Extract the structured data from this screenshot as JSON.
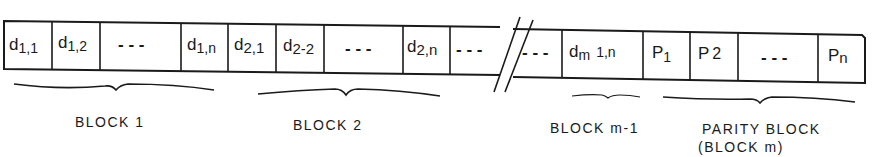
{
  "diagram": {
    "strip": {
      "cells": [
        {
          "id": "d11",
          "main": "d",
          "sub": "1,1",
          "x1": 4,
          "x2": 52
        },
        {
          "id": "d12",
          "main": "d",
          "sub": "1,2",
          "x1": 52,
          "x2": 100
        },
        {
          "id": "e1",
          "main": "---",
          "sub": "",
          "x1": 100,
          "x2": 181
        },
        {
          "id": "d1n",
          "main": "d",
          "sub": "1,n",
          "x1": 181,
          "x2": 228
        },
        {
          "id": "d21",
          "main": "d",
          "sub": "2,1",
          "x1": 228,
          "x2": 276
        },
        {
          "id": "d22",
          "main": "d",
          "sub": "2-2",
          "x1": 276,
          "x2": 324
        },
        {
          "id": "e2",
          "main": "---",
          "sub": "",
          "x1": 324,
          "x2": 403
        },
        {
          "id": "d2n",
          "main": "d",
          "sub": "2,n",
          "x1": 403,
          "x2": 450
        },
        {
          "id": "e3",
          "main": "---",
          "sub": "",
          "x1": 450,
          "x2": 500
        },
        {
          "id": "e4",
          "main": "---",
          "sub": "",
          "x1": 513,
          "x2": 562
        },
        {
          "id": "dm1n",
          "main": "d",
          "sub": "m",
          "extra": "1,n",
          "x1": 562,
          "x2": 643
        },
        {
          "id": "p1",
          "main": "P",
          "sub": "1",
          "x1": 643,
          "x2": 690
        },
        {
          "id": "p2",
          "main": "P",
          "sub": "2",
          "x1": 690,
          "x2": 738
        },
        {
          "id": "e5",
          "main": "---",
          "sub": "",
          "x1": 738,
          "x2": 818
        },
        {
          "id": "pn",
          "main": "P",
          "sub": "n",
          "x1": 818,
          "x2": 865
        }
      ],
      "break_symbol": "//"
    },
    "braces": [
      {
        "id": "block1",
        "label": "BLOCK 1",
        "x1": 14,
        "x2": 214,
        "y": 86,
        "label_x": 75,
        "label_y": 127
      },
      {
        "id": "block2",
        "label": "BLOCK 2",
        "x1": 258,
        "x2": 440,
        "y": 90,
        "label_x": 293,
        "label_y": 130
      },
      {
        "id": "blockm1",
        "label": "BLOCK m-1",
        "x1": 572,
        "x2": 640,
        "y": 96,
        "label_x": 550,
        "label_y": 133
      },
      {
        "id": "parity",
        "label": "PARITY BLOCK",
        "label2": "(BLOCK m)",
        "x1": 663,
        "x2": 855,
        "y": 98,
        "label_x": 702,
        "label_y": 134
      }
    ]
  }
}
